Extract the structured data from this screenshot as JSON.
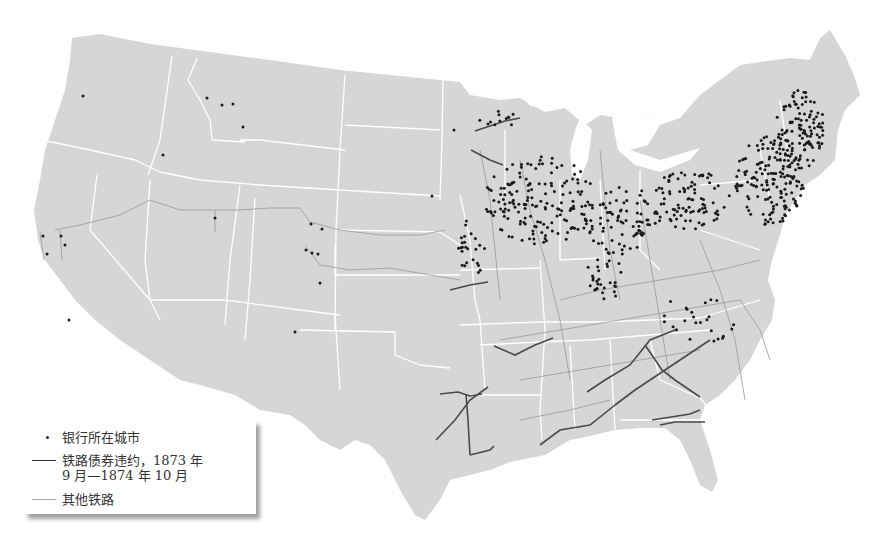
{
  "legend": {
    "items": [
      {
        "symbol": "dot",
        "label": "银行所在城市"
      },
      {
        "symbol": "dark-line",
        "label": "铁路债券违约，1873 年\n9 月—1874 年 10 月"
      },
      {
        "symbol": "light-line",
        "label": "其他铁路"
      }
    ]
  },
  "colors": {
    "land": "#d6d6d6",
    "state_border": "#ffffff",
    "bank_dot": "#1a1a1a",
    "defaulted_rail": "#4a4a4a",
    "other_rail": "#9a9a9a"
  },
  "map": {
    "subject": "United States, 1873–1874: bank cities and railroads",
    "western_bank_cities": [
      [
        83,
        96
      ],
      [
        207,
        98
      ],
      [
        222,
        105
      ],
      [
        233,
        104
      ],
      [
        243,
        127
      ],
      [
        163,
        155
      ],
      [
        215,
        218
      ],
      [
        311,
        224
      ],
      [
        322,
        229
      ],
      [
        306,
        250
      ],
      [
        312,
        253
      ],
      [
        318,
        254
      ],
      [
        320,
        283
      ],
      [
        295,
        332
      ],
      [
        69,
        320
      ],
      [
        43,
        236
      ],
      [
        47,
        254
      ],
      [
        61,
        236
      ],
      [
        65,
        245
      ],
      [
        432,
        196
      ],
      [
        454,
        130
      ]
    ],
    "defaulted_rail_lines": [
      "M475,131 L505,121 L520,118",
      "M471,150 L490,160 L503,165",
      "M450,290 L470,285 L488,282",
      "M440,394 L458,392 L470,396 L482,394",
      "M436,440 L455,420 L470,400 L488,387",
      "M466,394 L468,420 L470,455",
      "M470,455 L490,450 L494,446",
      "M494,346 L515,355 L535,345 L553,338",
      "M540,445 L560,430 L590,425 L615,405",
      "M587,392 L605,380 L630,365 L650,340 L675,330",
      "M615,405 L635,390 L650,380 L680,360 L710,340",
      "M645,345 L662,370 L675,380 L700,397",
      "M652,420 L690,414 L700,410",
      "M660,425 L675,422 L705,422"
    ],
    "other_rail_lines": [
      "M55,230 L80,225 L120,215 L150,200 L180,210 L215,210 L240,210 L270,208 L300,208 L310,222 L340,230 L380,235 L420,235 L445,230",
      "M215,210 L215,232",
      "M305,245 L320,265 L350,270 L390,268 L430,275 L460,280",
      "M60,230 L62,260",
      "M40,232 L44,260",
      "M480,150 L490,200 L495,250 L500,300",
      "M520,160 L530,210 L545,260 L560,320 L570,380",
      "M600,150 L605,200 L610,250 L620,300",
      "M640,200 L650,260 L660,320 L670,380",
      "M700,240 L720,290 L735,340 L745,400",
      "M560,300 L600,290 L660,280 L720,270 L760,260",
      "M500,340 L560,330 L620,320 L680,310 L740,300",
      "M520,380 L580,370 L640,360 L700,350",
      "M520,420 L570,410 L610,400",
      "M740,300 L760,330 L770,360"
    ],
    "eastern_bank_clusters": [
      {
        "cx": 540,
        "cy": 200,
        "rx": 55,
        "ry": 45,
        "n": 160
      },
      {
        "cx": 620,
        "cy": 220,
        "rx": 40,
        "ry": 35,
        "n": 90
      },
      {
        "cx": 690,
        "cy": 200,
        "rx": 40,
        "ry": 30,
        "n": 90
      },
      {
        "cx": 770,
        "cy": 180,
        "rx": 35,
        "ry": 45,
        "n": 160
      },
      {
        "cx": 800,
        "cy": 130,
        "rx": 25,
        "ry": 40,
        "n": 110
      },
      {
        "cx": 605,
        "cy": 275,
        "rx": 20,
        "ry": 25,
        "n": 30
      },
      {
        "cx": 470,
        "cy": 250,
        "rx": 15,
        "ry": 30,
        "n": 25
      },
      {
        "cx": 700,
        "cy": 320,
        "rx": 40,
        "ry": 30,
        "n": 25
      },
      {
        "cx": 495,
        "cy": 120,
        "rx": 20,
        "ry": 15,
        "n": 12
      }
    ]
  }
}
